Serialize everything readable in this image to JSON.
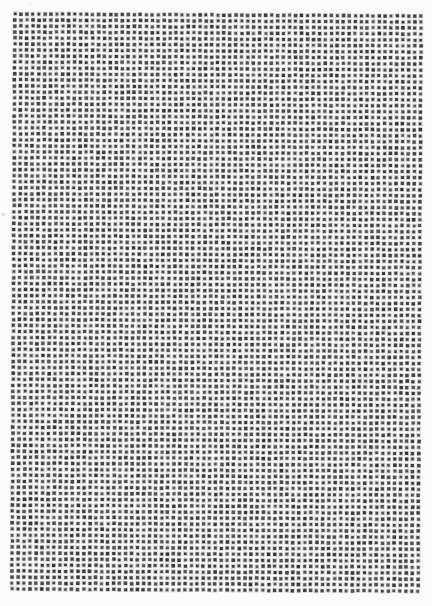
{
  "page": {
    "width": 432,
    "height": 606,
    "background": "#fcfcfc"
  },
  "dot_grid": {
    "columns": 69,
    "rows": 97,
    "origin_x": 13.5,
    "origin_y": 15,
    "pitch_x": 5.97,
    "pitch_y": 5.99,
    "dot_size": 3.0,
    "halo_size": 4.6,
    "dot_color": "#464646",
    "halo_color": "#969696",
    "halo_opacity": 0.45,
    "rotation_deg": 0.3,
    "jitter_px": 0.35,
    "shade_variation": 18,
    "noise_speck_count": 140,
    "seed": 7
  },
  "artifacts": [
    {
      "x": 3.5,
      "y": 214.5,
      "size": 4,
      "color": "#d6d6d6",
      "opacity": 0.7
    },
    {
      "x": 30,
      "y": 4,
      "size": 3,
      "color": "#e3e3e3",
      "opacity": 0.5
    }
  ]
}
